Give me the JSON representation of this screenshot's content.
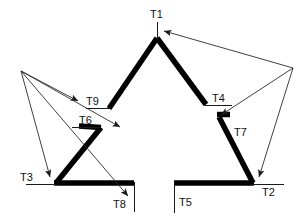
{
  "figure": {
    "background_color": "#ffffff",
    "shape_color": "#000000",
    "annotation_color": "#333333",
    "stroke_width_thick": 5.5,
    "stroke_width_thin": 1.0
  },
  "labels": {
    "t1": "T1",
    "t2": "T2",
    "t3": "T3",
    "t4": "T4",
    "t5": "T5",
    "t6": "T6",
    "t7": "T7",
    "t8": "T8",
    "t9": "T9"
  },
  "label_positions": {
    "t1": {
      "x": 150,
      "y": 18
    },
    "t2": {
      "x": 262,
      "y": 196
    },
    "t3": {
      "x": 20,
      "y": 181
    },
    "t4": {
      "x": 212,
      "y": 101
    },
    "t5": {
      "x": 179,
      "y": 205
    },
    "t6": {
      "x": 79,
      "y": 121
    },
    "t7": {
      "x": 234,
      "y": 135
    },
    "t8": {
      "x": 112,
      "y": 207
    },
    "t9": {
      "x": 86,
      "y": 105
    }
  },
  "vertices": {
    "t1_apex": {
      "x": 157,
      "y": 38
    },
    "t9_inner": {
      "x": 109,
      "y": 109
    },
    "t6_inner": {
      "x": 79,
      "y": 126
    },
    "t3_left": {
      "x": 56,
      "y": 183
    },
    "t8_bottom_end": {
      "x": 133,
      "y": 183
    },
    "t5_bottom_start": {
      "x": 175,
      "y": 183
    },
    "t2_right": {
      "x": 252,
      "y": 182
    },
    "t7_inner": {
      "x": 219,
      "y": 117
    },
    "t4_inner": {
      "x": 205,
      "y": 104
    }
  },
  "tick_lines": {
    "t1": {
      "x1": 157,
      "y1": 22,
      "x2": 157,
      "y2": 38
    },
    "t9": {
      "x1": 86,
      "y1": 108,
      "x2": 110,
      "y2": 108
    },
    "t6": {
      "x1": 72,
      "y1": 127,
      "x2": 101,
      "y2": 127
    },
    "t4": {
      "x1": 205,
      "y1": 105,
      "x2": 231,
      "y2": 105
    },
    "t3": {
      "x1": 26,
      "y1": 184,
      "x2": 57,
      "y2": 184
    },
    "t2": {
      "x1": 252,
      "y1": 184,
      "x2": 283,
      "y2": 184
    },
    "t8": {
      "x1": 134,
      "y1": 183,
      "x2": 134,
      "y2": 212
    },
    "t5": {
      "x1": 174,
      "y1": 183,
      "x2": 174,
      "y2": 213
    }
  },
  "annotations": {
    "left_origin": {
      "x": 21,
      "y": 71
    },
    "right_origin": {
      "x": 293,
      "y": 68
    },
    "arrows": [
      {
        "name": "arrow-to-t9",
        "from": "left_origin",
        "x1": 21,
        "y1": 71,
        "x2": 80,
        "y2": 102
      },
      {
        "name": "arrow-to-t3",
        "from": "left_origin",
        "x1": 21,
        "y1": 71,
        "x2": 50,
        "y2": 178
      },
      {
        "name": "arrow-to-t8",
        "from": "left_origin",
        "x1": 21,
        "y1": 71,
        "x2": 128,
        "y2": 196
      },
      {
        "name": "arrow-to-t6",
        "from": "left_origin",
        "x1": 21,
        "y1": 71,
        "x2": 78,
        "y2": 124
      },
      {
        "name": "arrow-to-t1",
        "from": "right_origin",
        "x1": 293,
        "y1": 68,
        "x2": 163,
        "y2": 32
      },
      {
        "name": "arrow-to-t7",
        "from": "right_origin",
        "x1": 293,
        "y1": 68,
        "x2": 220,
        "y2": 116
      },
      {
        "name": "arrow-to-t2",
        "from": "right_origin",
        "x1": 293,
        "y1": 68,
        "x2": 259,
        "y2": 178
      }
    ]
  }
}
